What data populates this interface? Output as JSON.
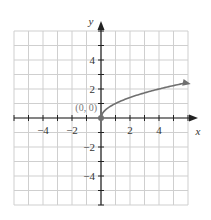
{
  "chart_data": {
    "type": "line",
    "title": "",
    "function": "y = sqrt(x)",
    "xlabel": "x",
    "ylabel": "y",
    "xlim": [
      -6,
      6
    ],
    "ylim": [
      -6,
      6
    ],
    "grid": true,
    "x_ticks": [
      -4,
      -2,
      2,
      4
    ],
    "y_ticks": [
      4,
      2,
      -2,
      -4
    ],
    "x_tick_labels": [
      "−4",
      "−2",
      "2",
      "4"
    ],
    "y_tick_labels": [
      "4",
      "2",
      "−2",
      "−4"
    ],
    "series": [
      {
        "name": "y = √x",
        "x": [
          0,
          0.25,
          0.5,
          1,
          1.5,
          2,
          2.5,
          3,
          3.5,
          4,
          4.5,
          5,
          5.5,
          6
        ],
        "y": [
          0,
          0.5,
          0.71,
          1,
          1.22,
          1.41,
          1.58,
          1.73,
          1.87,
          2,
          2.12,
          2.24,
          2.35,
          2.45
        ],
        "color": "#707070",
        "arrow_end": true
      }
    ],
    "annotations": [
      {
        "text": "(0, 0)",
        "x": 0,
        "y": 0,
        "marker": "filled-circle"
      }
    ]
  },
  "labels": {
    "x_axis": "x",
    "y_axis": "y",
    "origin_point": "(0, 0)",
    "x_ticks": [
      "−4",
      "−2",
      "2",
      "4"
    ],
    "y_ticks": [
      "4",
      "2",
      "−2",
      "−4"
    ]
  },
  "colors": {
    "grid": "#cfcfcf",
    "axis": "#222222",
    "curve": "#707070",
    "point": "#707070"
  }
}
